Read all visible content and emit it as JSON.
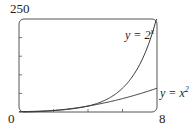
{
  "chart_data": {
    "type": "line",
    "title": "",
    "xlabel": "",
    "ylabel": "",
    "xlim": [
      0,
      8
    ],
    "ylim": [
      0,
      250
    ],
    "x_tick_labels": [
      "0",
      "8"
    ],
    "y_tick_labels": [
      "0",
      "250"
    ],
    "x_ticks": [
      2,
      4,
      6
    ],
    "y_ticks": [
      50,
      100,
      150,
      200
    ],
    "grid": false,
    "series": [
      {
        "name": "y = 2^x",
        "label": "y = 2",
        "label_sup": "x",
        "x": [
          0,
          1,
          2,
          3,
          4,
          5,
          6,
          7,
          8
        ],
        "values": [
          1,
          2,
          4,
          8,
          16,
          32,
          64,
          128,
          256
        ]
      },
      {
        "name": "y = x^2",
        "label": "y = x",
        "label_sup": "2",
        "x": [
          0,
          1,
          2,
          3,
          4,
          5,
          6,
          7,
          8
        ],
        "values": [
          0,
          1,
          4,
          9,
          16,
          25,
          36,
          49,
          64
        ]
      }
    ]
  },
  "labels": {
    "y_max": "250",
    "origin": "0",
    "x_max": "8"
  }
}
